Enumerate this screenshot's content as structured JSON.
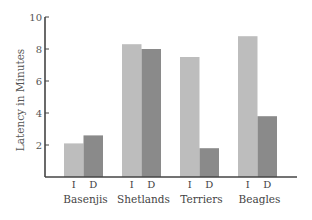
{
  "chart_data": {
    "type": "bar",
    "title": "",
    "xlabel": "",
    "ylabel": "Latency in Minutes",
    "ylim": [
      0,
      10
    ],
    "yticks": [
      2,
      4,
      6,
      8,
      10
    ],
    "grid": false,
    "legend": "none",
    "categories": [
      "Basenjis",
      "Shetlands",
      "Terriers",
      "Beagles"
    ],
    "series": [
      {
        "name": "I",
        "color": "#bdbdbd",
        "values": [
          2.1,
          8.3,
          7.5,
          8.8
        ]
      },
      {
        "name": "D",
        "color": "#8a8a8a",
        "values": [
          2.6,
          8.0,
          1.8,
          3.8
        ]
      }
    ]
  }
}
